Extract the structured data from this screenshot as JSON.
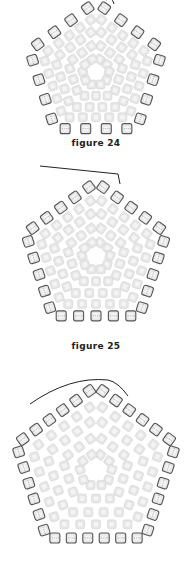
{
  "figures": [
    {
      "id": "fig24",
      "caption": "figure 24",
      "top": 0,
      "cy": 70,
      "r_outer": 76,
      "edge_beads": 4,
      "needle": "top-right-short"
    },
    {
      "id": "fig25",
      "caption": "figure 25",
      "top": 178,
      "cy": 82,
      "r_outer": 80,
      "edge_beads": 5,
      "needle": "top-left-long"
    },
    {
      "id": "fig26",
      "caption": "",
      "top": 370,
      "cy": 100,
      "r_outer": 86,
      "edge_beads": 6,
      "needle": "top-left-curve"
    }
  ],
  "captions": {
    "fig24": "figure 24",
    "fig25": "figure 25"
  },
  "colors": {
    "bead_fill": "#e6e6e6",
    "bead_light": "#f7f7f7",
    "outline": "#555555",
    "thread": "#222222",
    "caption": "#222222"
  },
  "icons": {
    "bead": "square-bead-icon",
    "needle": "needle-icon"
  }
}
